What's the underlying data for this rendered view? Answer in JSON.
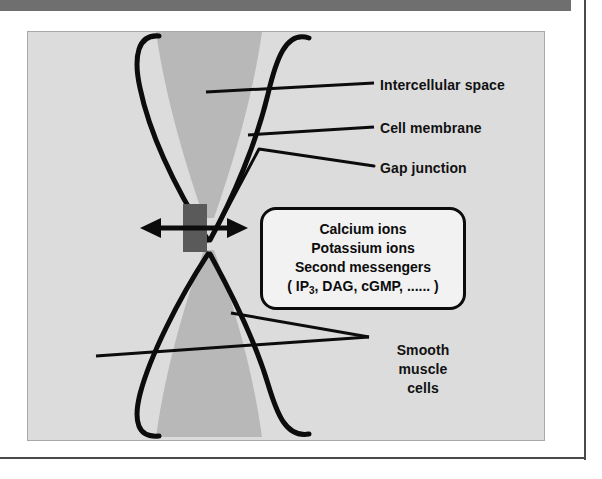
{
  "figure": {
    "labels": {
      "intercellular_space": "Intercellular space",
      "cell_membrane": "Cell membrane",
      "gap_junction": "Gap junction",
      "smooth_muscle_cells": "Smooth\nmuscle\ncells"
    },
    "callout": {
      "line1": "Calcium ions",
      "line2": "Potassium ions",
      "line3": "Second messengers",
      "line4_prefix": "( IP",
      "line4_sub": "3",
      "line4_suffix": ", DAG,  cGMP, ...... )"
    },
    "colors": {
      "panel_background": "#dcdcdc",
      "intercellular_wedge": "#b8b8b8",
      "membrane_stroke": "#0c0c0c",
      "junction_block": "#5a5a5a",
      "callout_background": "#f2f2f2",
      "top_bar": "#6f6f6f",
      "rule": "#4a4a4a",
      "text": "#111111"
    }
  }
}
